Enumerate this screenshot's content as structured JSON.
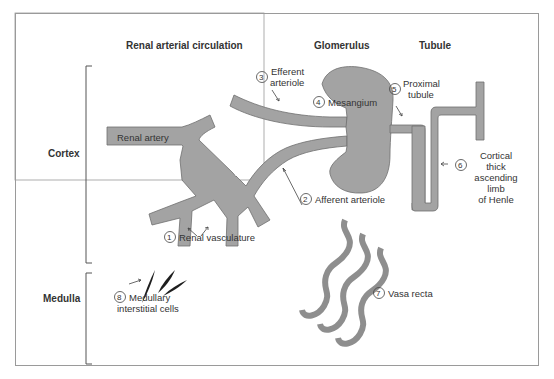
{
  "headers": {
    "renal_arterial_circulation": "Renal arterial circulation",
    "glomerulus": "Glomerulus",
    "tubule": "Tubule"
  },
  "regions": {
    "cortex": "Cortex",
    "medulla": "Medulla"
  },
  "structures": {
    "renal_artery": "Renal artery"
  },
  "labels": [
    {
      "num": "1",
      "text": "Renal vasculature"
    },
    {
      "num": "2",
      "text": "Afferent arteriole"
    },
    {
      "num": "3",
      "line1": "Efferent",
      "line2": "arteriole"
    },
    {
      "num": "4",
      "text": "Mesangium"
    },
    {
      "num": "5",
      "line1": "Proximal",
      "line2": "tubule"
    },
    {
      "num": "6",
      "line1": "Cortical",
      "line2": "thick",
      "line3": "ascending",
      "line4": "limb",
      "line5": "of Henle"
    },
    {
      "num": "7",
      "text": "Vasa recta"
    },
    {
      "num": "8",
      "line1": "Medullary",
      "line2": "interstitial cells"
    }
  ],
  "colors": {
    "vessel_fill": "#a3a3a3",
    "vessel_stroke": "#707070",
    "cell_fill": "#222222",
    "frame": "#999999",
    "text": "#333333"
  }
}
